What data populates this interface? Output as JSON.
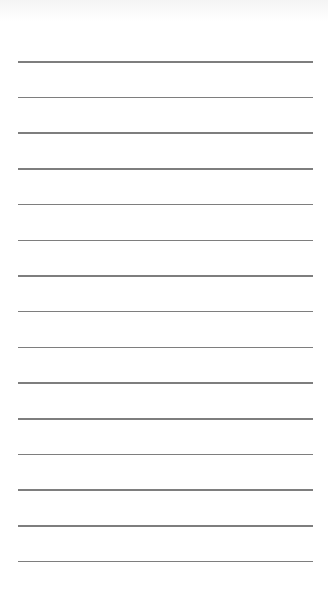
{
  "page": {
    "background": "#ffffff",
    "line_color": "#7e7e7e",
    "line_count": 15,
    "first_line_y": 61,
    "line_spacing": 35.7,
    "line_left": 18,
    "line_width": 295
  },
  "lines": [
    {
      "id": 1
    },
    {
      "id": 2
    },
    {
      "id": 3
    },
    {
      "id": 4
    },
    {
      "id": 5
    },
    {
      "id": 6
    },
    {
      "id": 7
    },
    {
      "id": 8
    },
    {
      "id": 9
    },
    {
      "id": 10
    },
    {
      "id": 11
    },
    {
      "id": 12
    },
    {
      "id": 13
    },
    {
      "id": 14
    },
    {
      "id": 15
    }
  ]
}
